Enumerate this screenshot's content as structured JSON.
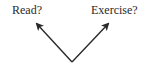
{
  "diagram": {
    "choices": [
      {
        "label": "Read?"
      },
      {
        "label": "Exercise?"
      }
    ],
    "arrow_color": "#2a2a2a",
    "text_color": "#2a2a2a"
  }
}
